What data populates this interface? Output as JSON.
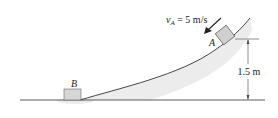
{
  "diagram": {
    "velocity_label": {
      "symbol": "v",
      "subscript": "A",
      "value": " = 5 m/s"
    },
    "block_a_label": "A",
    "block_b_label": "B",
    "height_label": "1.5 m",
    "colors": {
      "block_fill": "#d6d6d6",
      "block_stroke": "#555555",
      "line": "#333333",
      "shadow": "#ececec"
    }
  }
}
